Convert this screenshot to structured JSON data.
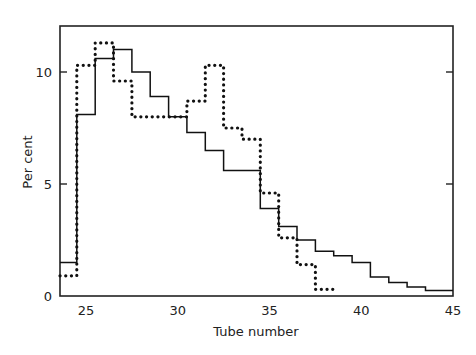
{
  "chart_data": {
    "type": "line",
    "subtype": "step-histogram",
    "title": "",
    "xlabel": "Tube number",
    "ylabel": "Per cent",
    "xlim": [
      23.5,
      45
    ],
    "ylim": [
      0,
      12.2
    ],
    "x_ticks": [
      25,
      30,
      35,
      40,
      45
    ],
    "y_ticks": [
      0,
      5,
      10
    ],
    "grid": false,
    "legend": null,
    "series": [
      {
        "name": "solid",
        "style": "solid",
        "x": [
          24,
          25,
          26,
          27,
          28,
          29,
          30,
          31,
          32,
          33,
          34,
          35,
          36,
          37,
          38,
          39,
          40,
          41,
          42,
          43,
          44,
          45
        ],
        "values": [
          1.5,
          8.1,
          10.6,
          11.0,
          10.0,
          8.9,
          8.0,
          7.3,
          6.5,
          5.6,
          5.6,
          3.9,
          3.1,
          2.5,
          2.0,
          1.8,
          1.5,
          0.85,
          0.6,
          0.4,
          0.25,
          0.25
        ]
      },
      {
        "name": "dotted",
        "style": "dotted",
        "x": [
          24,
          25,
          26,
          27,
          28,
          29,
          30,
          31,
          32,
          33,
          34,
          35,
          36,
          37,
          38
        ],
        "values": [
          0.9,
          10.3,
          11.3,
          9.6,
          8.0,
          8.0,
          8.0,
          8.7,
          10.3,
          7.5,
          7.0,
          4.6,
          2.6,
          1.4,
          0.3
        ]
      }
    ]
  },
  "axis": {
    "x_tick_labels": [
      "25",
      "30",
      "35",
      "40",
      "45"
    ],
    "y_tick_labels": [
      "0",
      "5",
      "10"
    ]
  }
}
